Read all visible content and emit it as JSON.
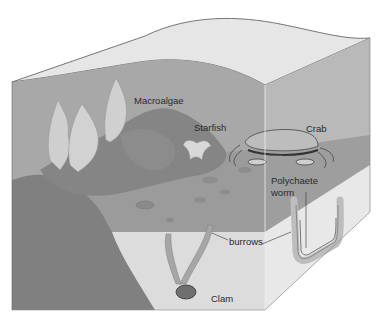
{
  "diagram": {
    "labels": {
      "macroalgae": "Macroalgae",
      "starfish": "Starfish",
      "crab": "Crab",
      "polychaete_line1": "Polychaete",
      "polychaete_line2": "worm",
      "burrows": "burrows",
      "clam": "Clam"
    },
    "colors": {
      "water_surface": "#e4e4e4",
      "water_front": "#a9a9a9",
      "water_side": "#b8b8b8",
      "rock_dark": "#7e7e7e",
      "rock_mid": "#8f8f8f",
      "seafloor": "#9a9a9a",
      "sediment_front": "#dadada",
      "sediment_side": "#e6e6e6",
      "algae": "#cfcfcf",
      "outline": "#555555"
    }
  }
}
